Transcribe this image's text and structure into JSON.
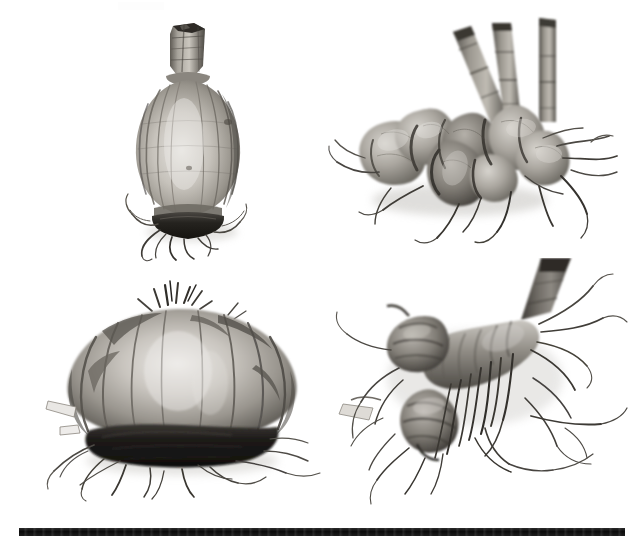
{
  "figure": {
    "kind": "grayscale-photographic-plate",
    "background_color": "#ffffff",
    "ink_color": "#121212",
    "layout": "2x2 grid of specimen photographs above a horizontal scale bar",
    "title_text": "",
    "caption_text": "",
    "visible_text": "none"
  },
  "scale_bar": {
    "name": "scale-bar",
    "label": "",
    "color": "#121212",
    "x_start_px": 19,
    "x_end_px": 625,
    "y_px": 528,
    "thickness_px": 8,
    "length_px": 606
  },
  "panels": [
    {
      "id": "a",
      "position": "top-left",
      "specimen": "tunicate bulb",
      "description": "pear-shaped bulb with cut stem remnant at apex, vertical ridged tunic, basal plate with roots",
      "label": "",
      "orientation": "upright",
      "tone_light": "#d9d7d2",
      "tone_mid": "#9a968f",
      "tone_dark": "#3a3733"
    },
    {
      "id": "b",
      "position": "top-right",
      "specimen": "tuber cluster",
      "description": "cluster of lobed tubers with three cut stems emerging at upper right and spreading fibrous roots",
      "label": "",
      "orientation": "lying on side",
      "stem_count": 3,
      "tone_light": "#cfccc6",
      "tone_mid": "#8f8b84",
      "tone_dark": "#35322e"
    },
    {
      "id": "c",
      "position": "bottom-left",
      "specimen": "corm",
      "description": "broad flattened corm with fibrous papery tunic and dense dark basal root mass",
      "label": "",
      "orientation": "lying flat",
      "tone_light": "#d4d1cb",
      "tone_mid": "#8d8982",
      "tone_dark": "#232120"
    },
    {
      "id": "d",
      "position": "bottom-right",
      "specimen": "rhizome",
      "description": "segmented rhizome with thick upright stem base and dense trailing root system",
      "label": "",
      "orientation": "oblique",
      "tone_light": "#cbc8c2",
      "tone_mid": "#85817a",
      "tone_dark": "#2b2926"
    }
  ]
}
